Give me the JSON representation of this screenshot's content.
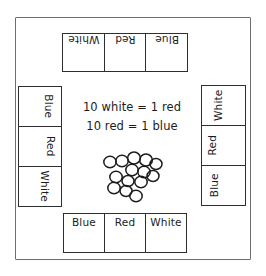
{
  "page": {
    "background_color": "#ffffff",
    "ink_color": "#1c1c1e",
    "frame_color": "#6e6e72"
  },
  "board": {
    "top_row": {
      "orientation": "rotated-180",
      "cells": [
        {
          "label": "White"
        },
        {
          "label": "Red"
        },
        {
          "label": "Blue"
        }
      ]
    },
    "left_column": {
      "orientation": "rotated-90-cw",
      "cells": [
        {
          "label": "Blue"
        },
        {
          "label": "Red"
        },
        {
          "label": "White"
        }
      ]
    },
    "right_column": {
      "orientation": "rotated-90-ccw",
      "cells": [
        {
          "label": "White"
        },
        {
          "label": "Red"
        },
        {
          "label": "Blue"
        }
      ]
    },
    "bottom_row": {
      "orientation": "upright",
      "cells": [
        {
          "label": "Blue"
        },
        {
          "label": "Red"
        },
        {
          "label": "White"
        }
      ]
    }
  },
  "center": {
    "equations": [
      "10 white = 1 red",
      "10 red = 1 blue"
    ],
    "chip_pile": {
      "count": 14,
      "fill": "none",
      "stroke": "#1c1c1e",
      "circles": [
        {
          "cx": 12,
          "cy": 14,
          "r": 6.2
        },
        {
          "cx": 24,
          "cy": 13,
          "r": 6.2
        },
        {
          "cx": 36,
          "cy": 10,
          "r": 6.4
        },
        {
          "cx": 48,
          "cy": 12,
          "r": 6.4
        },
        {
          "cx": 58,
          "cy": 16,
          "r": 6.0
        },
        {
          "cx": 34,
          "cy": 22,
          "r": 6.2
        },
        {
          "cx": 46,
          "cy": 24,
          "r": 6.2
        },
        {
          "cx": 18,
          "cy": 29,
          "r": 6.2
        },
        {
          "cx": 30,
          "cy": 33,
          "r": 6.0
        },
        {
          "cx": 43,
          "cy": 34,
          "r": 6.2
        },
        {
          "cx": 55,
          "cy": 28,
          "r": 6.0
        },
        {
          "cx": 16,
          "cy": 40,
          "r": 6.2
        },
        {
          "cx": 28,
          "cy": 43,
          "r": 6.0
        },
        {
          "cx": 38,
          "cy": 48,
          "r": 6.2
        }
      ]
    }
  }
}
